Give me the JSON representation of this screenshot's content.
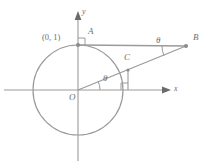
{
  "figure": {
    "background_color": "#ffffff",
    "stroke_color": "#9a9a9a",
    "label_color": "#6e6e6e",
    "width": 212,
    "height": 166
  },
  "axes": {
    "x_label": "x",
    "y_label": "y",
    "origin_label": "O",
    "origin": {
      "x": 78,
      "y": 90
    },
    "x_axis": {
      "from_x": 4,
      "to_x": 170,
      "y": 90,
      "arrow": true
    },
    "y_axis": {
      "x": 78,
      "from_y": 160,
      "to_y": 12,
      "arrow": true
    }
  },
  "circle": {
    "center_x": 78,
    "center_y": 90,
    "radius": 45,
    "name": "unit-circle"
  },
  "points": {
    "A": {
      "label": "A",
      "x": 78,
      "y": 45,
      "label_x": 86,
      "label_y": 31
    },
    "B": {
      "label": "B",
      "x": 186,
      "y": 46,
      "label_x": 193,
      "label_y": 36
    },
    "C": {
      "label": "C",
      "x": 128,
      "y": 70,
      "label_x": 127,
      "label_y": 56
    },
    "O": {
      "label": "O",
      "x": 78,
      "y": 90,
      "label_x": 70,
      "label_y": 94
    }
  },
  "coordinate_labels": {
    "A_coords": "(0, 1)",
    "A_coords_x": 45,
    "A_coords_y": 37
  },
  "angles": {
    "at_origin": {
      "label": "θ",
      "label_x": 106,
      "label_y": 78,
      "arc_radius": 22
    },
    "at_B": {
      "label": "θ",
      "label_x": 160,
      "label_y": 40,
      "arc_radius": 24
    }
  },
  "right_angles": [
    {
      "name": "right-angle-at-A",
      "x": 78,
      "y": 45,
      "size": 7
    },
    {
      "name": "right-angle-at-x-axis-foot",
      "x": 128,
      "y": 90,
      "size": 7
    }
  ],
  "segments": [
    {
      "name": "segment-AB",
      "x1": 78,
      "y1": 45,
      "x2": 186,
      "y2": 46
    },
    {
      "name": "segment-OB",
      "x1": 78,
      "y1": 90,
      "x2": 186,
      "y2": 46
    },
    {
      "name": "segment-C-perpendicular",
      "x1": 128,
      "y1": 70,
      "x2": 128,
      "y2": 90
    }
  ]
}
